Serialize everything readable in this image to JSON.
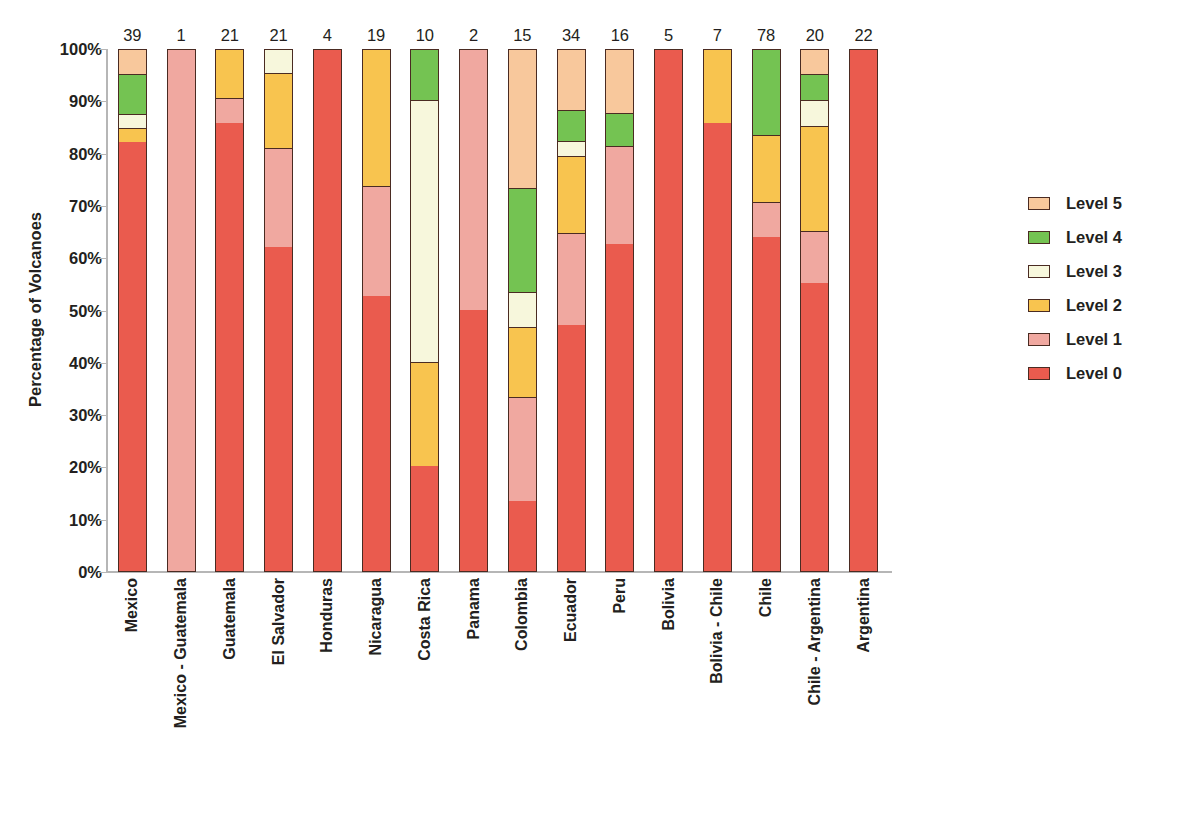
{
  "chart_data": {
    "type": "bar",
    "subtype": "stacked-100-percent",
    "title": "",
    "xlabel": "",
    "ylabel": "Percentage of Volcanoes",
    "ylim": [
      0,
      100
    ],
    "ytick_labels": [
      "100%",
      "90%",
      "80%",
      "70%",
      "60%",
      "50%",
      "40%",
      "30%",
      "20%",
      "10%",
      "0%"
    ],
    "ytick_values": [
      100,
      90,
      80,
      70,
      60,
      50,
      40,
      30,
      20,
      10,
      0
    ],
    "grid": false,
    "legend_position": "right",
    "bar_counts_note": "Number above each bar is the count of volcanoes in that segment",
    "categories": [
      "Mexico",
      "Mexico - Guatemala",
      "Guatemala",
      "El Salvador",
      "Honduras",
      "Nicaragua",
      "Costa Rica",
      "Panama",
      "Colombia",
      "Ecuador",
      "Peru",
      "Bolivia",
      "Bolivia - Chile",
      "Chile",
      "Chile - Argentina",
      "Argentina"
    ],
    "counts": [
      39,
      1,
      21,
      21,
      4,
      19,
      10,
      2,
      15,
      34,
      16,
      5,
      7,
      78,
      20,
      22
    ],
    "series": [
      {
        "name": "Level 0",
        "color": "#ea5b4e",
        "values": [
          82.1,
          0.0,
          85.7,
          61.9,
          100.0,
          52.6,
          20.0,
          50.0,
          13.3,
          47.1,
          62.5,
          100.0,
          85.7,
          63.8,
          55.0,
          100.0
        ]
      },
      {
        "name": "Level 1",
        "color": "#f0a8a0",
        "values": [
          0.0,
          100.0,
          4.8,
          19.0,
          0.0,
          21.1,
          0.0,
          50.0,
          20.0,
          17.6,
          18.8,
          0.0,
          0.0,
          6.7,
          10.0,
          0.0
        ]
      },
      {
        "name": "Level 2",
        "color": "#f8c44f",
        "values": [
          2.6,
          0.0,
          9.5,
          14.3,
          0.0,
          26.3,
          20.0,
          0.0,
          13.3,
          14.7,
          0.0,
          0.0,
          14.3,
          12.8,
          20.0,
          0.0
        ]
      },
      {
        "name": "Level 3",
        "color": "#f7f7dc",
        "values": [
          2.6,
          0.0,
          0.0,
          4.8,
          0.0,
          0.0,
          50.0,
          0.0,
          6.7,
          2.9,
          0.0,
          0.0,
          0.0,
          0.0,
          5.0,
          0.0
        ]
      },
      {
        "name": "Level 4",
        "color": "#74c352",
        "values": [
          7.7,
          0.0,
          0.0,
          0.0,
          0.0,
          0.0,
          10.0,
          0.0,
          20.0,
          5.9,
          6.2,
          0.0,
          0.0,
          16.7,
          5.0,
          0.0
        ]
      },
      {
        "name": "Level 5",
        "color": "#f8c89c",
        "values": [
          5.1,
          0.0,
          0.0,
          0.0,
          0.0,
          0.0,
          0.0,
          0.0,
          26.7,
          11.8,
          12.5,
          0.0,
          0.0,
          0.0,
          5.0,
          0.0
        ]
      }
    ]
  },
  "legend": {
    "entries": [
      {
        "label": "Level 5",
        "color": "#f8c89c"
      },
      {
        "label": "Level 4",
        "color": "#74c352"
      },
      {
        "label": "Level 3",
        "color": "#f7f7dc"
      },
      {
        "label": "Level 2",
        "color": "#f8c44f"
      },
      {
        "label": "Level 1",
        "color": "#f0a8a0"
      },
      {
        "label": "Level 0",
        "color": "#ea5b4e"
      }
    ]
  },
  "axis": {
    "y_title": "Percentage of Volcanoes"
  },
  "colors": {
    "outline": "#4a2b22",
    "axis": "#b6b6b6",
    "text": "#231f20",
    "background": "#ffffff"
  }
}
